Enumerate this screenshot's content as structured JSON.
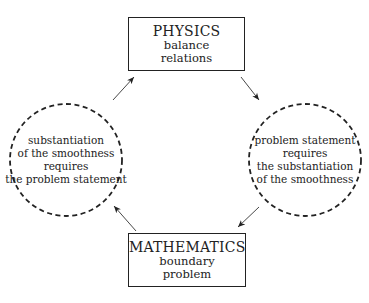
{
  "top_box": {
    "title": "PHYSICS",
    "line1": "balance",
    "line2": "relations"
  },
  "bottom_box": {
    "title": "MATHEMATICS",
    "line1": "boundary",
    "line2": "problem"
  },
  "left_circle": {
    "line1": "substantiation",
    "line2": "of the smoothness",
    "line3": "requires",
    "line4": "the problem statement"
  },
  "right_circle": {
    "line1": "problem statement",
    "line2": "requires",
    "line3": "the substantiation",
    "line4": "of the smoothness"
  },
  "arrows": [
    {
      "from": "left_circle",
      "to": "top_box"
    },
    {
      "from": "top_box",
      "to": "right_circle"
    },
    {
      "from": "right_circle",
      "to": "bottom_box"
    },
    {
      "from": "bottom_box",
      "to": "left_circle"
    }
  ]
}
